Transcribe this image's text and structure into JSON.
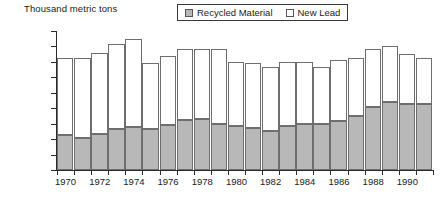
{
  "chart_data": {
    "type": "bar",
    "subtype": "stacked-bar",
    "title": "",
    "ylabel": "Thousand metric tons",
    "xlabel": "",
    "ylim": [
      0,
      1800
    ],
    "ytick_step": 200,
    "grid": false,
    "legend_position": "top-center",
    "categories": [
      "1970",
      "1971",
      "1972",
      "1973",
      "1974",
      "1975",
      "1976",
      "1977",
      "1978",
      "1979",
      "1980",
      "1981",
      "1982",
      "1983",
      "1984",
      "1985",
      "1986",
      "1987",
      "1988",
      "1989",
      "1990",
      "1991"
    ],
    "xtick_labels": [
      "1970",
      "1972",
      "1974",
      "1976",
      "1978",
      "1980",
      "1982",
      "1984",
      "1986",
      "1988",
      "1990"
    ],
    "ytick_labels": [
      "0",
      "200",
      "400",
      "600",
      "800",
      "1000",
      "1200",
      "1400",
      "1600",
      "1800"
    ],
    "series": [
      {
        "name": "Recycled Material",
        "color": "#b8b8b8",
        "values": [
          450,
          420,
          460,
          530,
          560,
          530,
          580,
          650,
          660,
          590,
          570,
          540,
          500,
          570,
          590,
          590,
          640,
          700,
          820,
          880,
          850,
          850
        ]
      },
      {
        "name": "New Lead",
        "color": "#ffffff",
        "values": [
          1000,
          1030,
          1060,
          1100,
          1140,
          850,
          900,
          920,
          910,
          980,
          830,
          850,
          830,
          830,
          810,
          740,
          780,
          750,
          750,
          720,
          650,
          600
        ]
      }
    ],
    "totals": [
      1450,
      1450,
      1520,
      1630,
      1700,
      1380,
      1480,
      1570,
      1570,
      1570,
      1400,
      1390,
      1330,
      1400,
      1400,
      1330,
      1420,
      1450,
      1570,
      1600,
      1500,
      1450
    ]
  },
  "legend": {
    "items": [
      {
        "label": "Recycled Material",
        "swatch": "recycled"
      },
      {
        "label": "New Lead",
        "swatch": "newlead"
      }
    ]
  },
  "colors": {
    "recycled_fill": "#b8b8b8",
    "newlead_fill": "#ffffff",
    "bar_outline": "#6e6e6e",
    "axis": "#2b2b2b",
    "text": "#1a1a1a"
  }
}
